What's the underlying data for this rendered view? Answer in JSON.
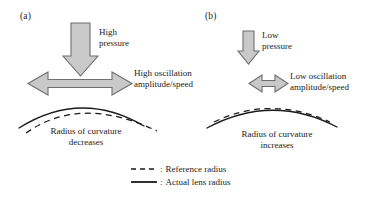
{
  "figure": {
    "panels": [
      {
        "id": "a",
        "label": "(a)",
        "pressure_text": "High\npressure",
        "oscillation_text": "High oscillation\namplitude/speed",
        "curvature_text": "Radius of curvature\ndecreases",
        "pressure_arrow": "large-down-block-arrow",
        "oscillation_arrow": "large-double-headed-horizontal-arrow"
      },
      {
        "id": "b",
        "label": "(b)",
        "pressure_text": "Low\npressure",
        "oscillation_text": "Low oscillation\namplitude/speed",
        "curvature_text": "Radius of curvature\nincreases",
        "pressure_arrow": "small-down-block-arrow",
        "oscillation_arrow": "small-double-headed-horizontal-arrow"
      }
    ],
    "legend": [
      {
        "style": "dashed",
        "separator": ":",
        "label": "Reference radius"
      },
      {
        "style": "solid",
        "separator": ":",
        "label": "Actual lens radius"
      }
    ],
    "colors": {
      "arrow_fill": "#c9c9c9",
      "arrow_stroke": "#6e6e6e",
      "curve_stroke": "#1a1a1a",
      "text": "#1a1a1a",
      "background": "#ffffff"
    }
  }
}
